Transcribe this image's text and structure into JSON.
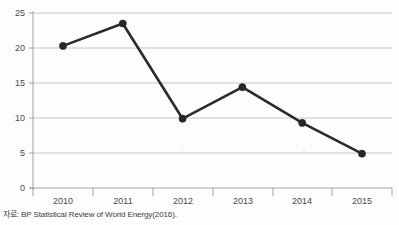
{
  "chart_data": {
    "type": "line",
    "title": "",
    "subtitle": "",
    "xlabel": "",
    "ylabel": "",
    "categories": [
      "2010",
      "2011",
      "2012",
      "2013",
      "2014",
      "2015"
    ],
    "values": [
      20.3,
      23.5,
      9.9,
      14.4,
      9.3,
      4.9
    ],
    "series": [
      {
        "name": "",
        "values": [
          20.3,
          23.5,
          9.9,
          14.4,
          9.3,
          4.9
        ]
      }
    ],
    "ylim": [
      0,
      25
    ],
    "yticks": [
      0,
      5,
      10,
      15,
      20,
      25
    ],
    "ytick_labels": [
      "0",
      "5",
      "10",
      "15",
      "20",
      "25"
    ],
    "xtick_labels": [
      "2010",
      "2011",
      "2012",
      "2013",
      "2014",
      "2015"
    ],
    "grid": true,
    "grid_axis": "y",
    "legend": false,
    "legend_position": "none",
    "marker": "circle",
    "colors": {
      "line": "#2b2b2b",
      "marker": "#262626",
      "gridline": "#b9b9b9",
      "axis": "#9a9a9a",
      "background": "#fdfdfb",
      "text": "#4a4a4a"
    },
    "annotations": []
  },
  "footer": {
    "source_note": "자료: BP Statistical Review of World Energy(2016)."
  }
}
